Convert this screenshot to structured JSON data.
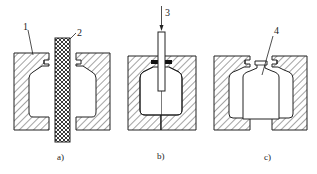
{
  "diagram": {
    "type": "process-diagram",
    "panels": [
      {
        "id": "a",
        "caption": "a)",
        "components": [
          {
            "callout": "1",
            "part": "mold"
          },
          {
            "callout": "2",
            "part": "parison"
          }
        ]
      },
      {
        "id": "b",
        "caption": "b)",
        "components": [
          {
            "callout": "3",
            "part": "blow pin"
          }
        ]
      },
      {
        "id": "c",
        "caption": "c)",
        "components": [
          {
            "callout": "4",
            "part": "product"
          }
        ]
      }
    ]
  },
  "labels": {
    "c1": "1",
    "c2": "2",
    "c3": "3",
    "c4": "4",
    "cap_a": "a)",
    "cap_b": "b)",
    "cap_c": "c)"
  },
  "colors": {
    "line": "#222222",
    "background": "#ffffff",
    "hatch": "#333333",
    "gasket": "#111111"
  }
}
